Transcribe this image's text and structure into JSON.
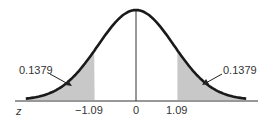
{
  "chart_data": {
    "type": "area",
    "xlabel": "z",
    "ylabel": "",
    "x_ticks": [
      "-1.09",
      "0",
      "1.09"
    ],
    "critical_values": [
      -1.09,
      1.09
    ],
    "series": [
      {
        "name": "left tail area",
        "range": [
          "-inf",
          -1.09
        ],
        "value": 0.1379
      },
      {
        "name": "right tail area",
        "range": [
          1.09,
          "inf"
        ],
        "value": 0.1379
      }
    ],
    "annotations": [
      "0.1379",
      "0.1379"
    ],
    "grid": false,
    "colors": {
      "curve": "#1a1a1a",
      "shade": "#c8c8c8",
      "axis": "#333333"
    }
  },
  "labels": {
    "axis_var": "z",
    "tick_left": "−1.09",
    "tick_center": "0",
    "tick_right": "1.09",
    "annot_left": "0.1379",
    "annot_right": "0.1379"
  }
}
